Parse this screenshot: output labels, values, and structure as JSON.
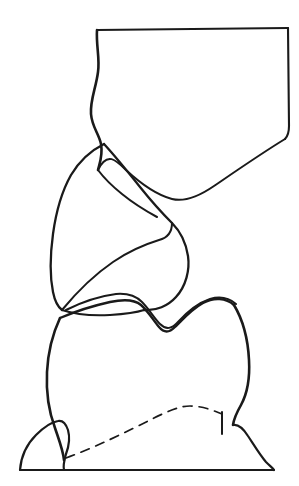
{
  "figure": {
    "width": 299,
    "height": 486,
    "background_color": "#ffffff",
    "ink_color": "#1a1a1a",
    "caption": {
      "text": "FIGURE 10-7 ,  (cont.)",
      "state": "cropped-at-top-edge",
      "note": "Only the lower fragments of the glyphs are visible in the screenshot."
    },
    "type": "line-drawing"
  },
  "elements": {
    "upper_tooth": {
      "label": "upper opposing tooth outline",
      "description": "Large quadrilateral crown occupying the top of the frame; flat horizontal top, wavy left flank, straight right flank ending in a curved distal sweep.",
      "bbox": [
        88,
        28,
        290,
        205
      ]
    },
    "middle_cusp": {
      "label": "middle cusp outline",
      "description": "Pointed leaf-shaped cusp between the upper tooth and the lower molar, with an internal ridge line.",
      "bbox": [
        48,
        142,
        196,
        312
      ]
    },
    "lower_molar": {
      "label": "lower molar crown",
      "description": "Broad rounded crown with a V-shaped central occlusal groove at its summit, set into the gingival tissue.",
      "bbox": [
        48,
        290,
        250,
        470
      ]
    },
    "gingiva": {
      "label": "gingival tissue base",
      "description": "Low mounded gum form spanning the bottom of the figure, resting on a straight horizontal baseline.",
      "bbox": [
        18,
        405,
        275,
        472
      ]
    },
    "gumline_dashed": {
      "label": "dashed gingival margin",
      "description": "Dashed arc tracing the hidden cervical margin of the lower molar beneath the gum.",
      "style": "dashed",
      "dash_pattern": "9 7"
    },
    "baseline": {
      "label": "horizontal baseline",
      "description": "Straight ruled line closing the bottom of the gingival form.",
      "y": 470
    }
  }
}
